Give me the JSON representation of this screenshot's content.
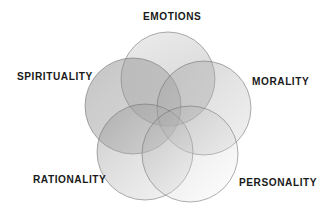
{
  "diagram": {
    "type": "venn",
    "sets": [
      {
        "id": "emotions",
        "label": "EMOTIONS",
        "cx": 168,
        "cy": 79,
        "r": 47
      },
      {
        "id": "spirituality",
        "label": "SPIRITUALITY",
        "cx": 133,
        "cy": 106,
        "r": 48
      },
      {
        "id": "morality",
        "label": "MORALITY",
        "cx": 204,
        "cy": 108,
        "r": 47
      },
      {
        "id": "rationality",
        "label": "RATIONALITY",
        "cx": 145,
        "cy": 152,
        "r": 48
      },
      {
        "id": "personality",
        "label": "PERSONALITY",
        "cx": 190,
        "cy": 154,
        "r": 48
      }
    ],
    "colors": {
      "fill_dark": "#8a8a8a",
      "fill_light": "#f2f2f2",
      "stroke": "#6e6e6e",
      "label": "#1a1a1a"
    }
  }
}
